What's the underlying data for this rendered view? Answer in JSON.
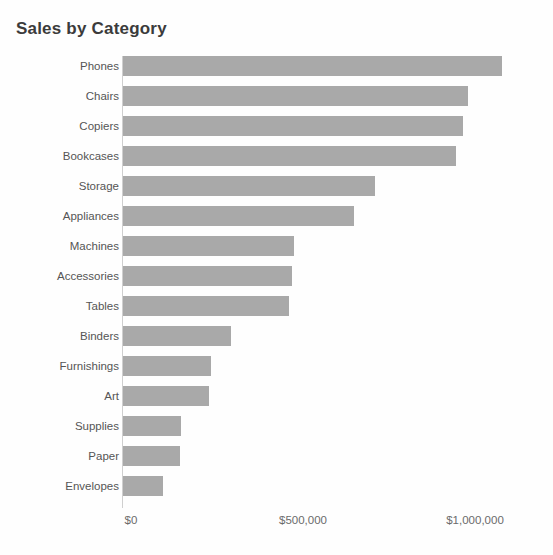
{
  "chart_data": {
    "type": "bar",
    "orientation": "horizontal",
    "title": "Sales by Category",
    "xlabel": "",
    "ylabel": "",
    "xlim": [
      0,
      1150000
    ],
    "grid": false,
    "legend": null,
    "bar_color": "#a9a9a9",
    "background_color": "#fefefe",
    "title_color": "#3b3b3b",
    "label_color": "#555555",
    "tick_color": "#6b6b6b",
    "x_tick_labels": [
      "$0",
      "$500,000",
      "$1,000,000"
    ],
    "x_tick_values": [
      0,
      500000,
      1000000
    ],
    "categories": [
      "Phones",
      "Chairs",
      "Copiers",
      "Bookcases",
      "Storage",
      "Appliances",
      "Machines",
      "Accessories",
      "Tables",
      "Binders",
      "Furnishings",
      "Art",
      "Supplies",
      "Paper",
      "Envelopes"
    ],
    "values": [
      1103000,
      1003000,
      989000,
      969000,
      734000,
      671000,
      497000,
      492000,
      483000,
      314000,
      257000,
      251000,
      169000,
      166000,
      117000
    ]
  }
}
